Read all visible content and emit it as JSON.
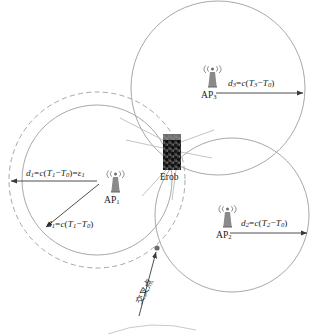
{
  "figure": {
    "kind": "toa-trilateration-positioning-diagram",
    "background": "#ffffff",
    "stroke_color": "#9a9a9a",
    "text_color": "#1a1a1a",
    "obstacle_color": "#2b2b2b"
  },
  "access_points": [
    {
      "id": "ap1",
      "name": "AP",
      "index": "1",
      "icon": "antenna-tower-icon",
      "center": [
        97,
        180
      ],
      "radius": 75,
      "dashed_radius": 88,
      "has_error_circle": true
    },
    {
      "id": "ap2",
      "name": "AP",
      "index": "2",
      "icon": "antenna-tower-icon",
      "center": [
        232,
        215
      ],
      "radius": 77,
      "has_error_circle": false
    },
    {
      "id": "ap3",
      "name": "AP",
      "index": "3",
      "icon": "antenna-tower-icon",
      "center": [
        218,
        88
      ],
      "radius": 87,
      "has_error_circle": false
    }
  ],
  "distance_labels": {
    "d1_error": {
      "d": "d",
      "d_sub": "1",
      "eq": "=",
      "c": "c",
      "open": "(",
      "T": "T",
      "T_sub": "1",
      "minus": "−",
      "T0": "T",
      "T0_sub": "0",
      "close": ")",
      "eq2": "=",
      "eps": "ε",
      "eps_sub": "1",
      "full": "d1=c(T1−T0)=ε1"
    },
    "d1": {
      "d": "d",
      "d_sub": "1",
      "eq": "=",
      "c": "c",
      "open": "(",
      "T": "T",
      "T_sub": "1",
      "minus": "−",
      "T0": "T",
      "T0_sub": "0",
      "close": ")",
      "full": "d1=c(T1−T0)"
    },
    "d2": {
      "d": "d",
      "d_sub": "2",
      "eq": "=",
      "c": "c",
      "open": "(",
      "T": "T",
      "T_sub": "2",
      "minus": "−",
      "T0": "T",
      "T0_sub": "0",
      "close": ")",
      "full": "d2=c(T2−T0)"
    },
    "d3": {
      "d": "d",
      "d_sub": "3",
      "eq": "=",
      "c": "c",
      "open": "(",
      "T": "T",
      "T_sub": "3",
      "minus": "−",
      "T0": "T",
      "T0_sub": "0",
      "close": ")",
      "full": "d3=c(T3−T0)"
    }
  },
  "obstacle": {
    "label": "Erob",
    "icon": "rock-obstacle-icon",
    "rect": [
      163,
      134,
      18,
      36
    ]
  },
  "intersection": {
    "label": "交叉点",
    "point": [
      157,
      248
    ],
    "rotation_deg": -62
  }
}
